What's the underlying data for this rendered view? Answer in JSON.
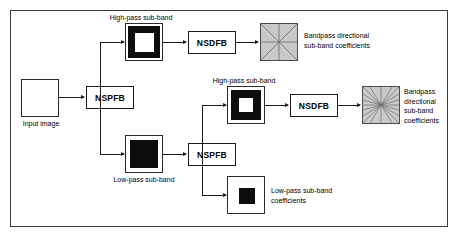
{
  "diagram": {
    "type": "flow-diagram",
    "frame_color": "#3a3a3a",
    "line_color": "#1a1a1a",
    "coefficient_fill": "#c9c9c9",
    "nodes": {
      "input_image": {
        "label": "Input image",
        "kind": "image-thumbnail",
        "fill": "#ffffff"
      },
      "nspfb_stage1": {
        "label": "NSPFB",
        "kind": "filter-bank"
      },
      "nspfb_stage2": {
        "label": "NSPFB",
        "kind": "filter-bank"
      },
      "nsdfb_stage1": {
        "label": "NSDFB",
        "kind": "filter-bank"
      },
      "nsdfb_stage2": {
        "label": "NSDFB",
        "kind": "filter-bank"
      },
      "highpass_stage1": {
        "label": "High-pass sub-band",
        "kind": "ring-thumbnail"
      },
      "highpass_stage2": {
        "label": "High-pass sub-band",
        "kind": "ring-thumbnail"
      },
      "lowpass_stage1": {
        "label": "Low-pass sub-band",
        "kind": "solid-thumbnail"
      },
      "bandpass_coeff_stage1": {
        "label": "Bandpass directional\nsub-band coefficients",
        "kind": "directional-coefficients",
        "directions": 4
      },
      "bandpass_coeff_stage2": {
        "label": "Bandpass\ndirectional\nsub-band\ncoefficients",
        "kind": "directional-coefficients",
        "directions": 16
      },
      "lowpass_coeff": {
        "label": "Low-pass sub-band\ncoefficients",
        "kind": "solid-thumbnail"
      }
    }
  }
}
